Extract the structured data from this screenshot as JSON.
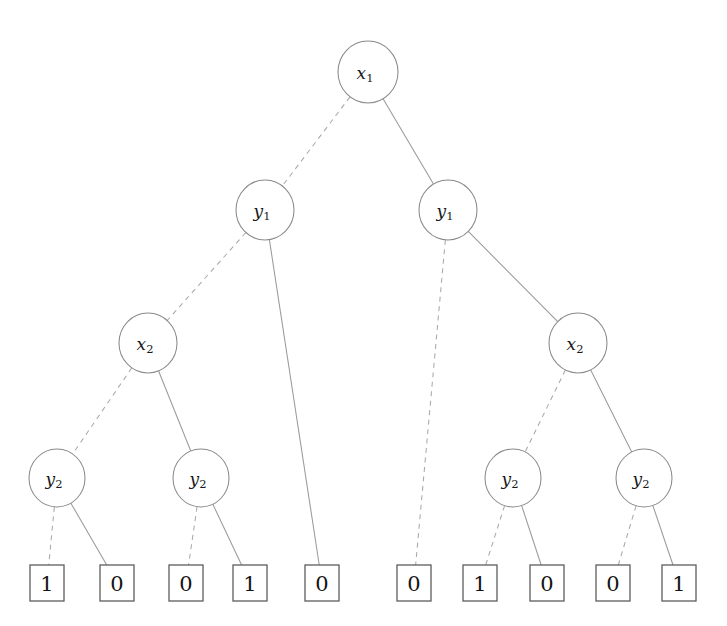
{
  "diagram": {
    "type": "binary-decision-diagram",
    "background_color": "#ffffff",
    "node_stroke_color": "#8a8a8a",
    "leaf_stroke_color": "#5d5d5d",
    "edge_solid_color": "#9a9a9a",
    "edge_dashed_color": "#a9a9a9",
    "text_color": "#18181a",
    "edge_legend": {
      "dashed": "0 / low branch (left)",
      "solid": "1 / high branch (right)"
    },
    "variables": [
      "x1",
      "y1",
      "x2",
      "y2"
    ],
    "levels": 4,
    "nodes": [
      {
        "id": "n0",
        "label_base": "x",
        "label_sub": "1",
        "level": 0,
        "cx": 368,
        "cy": 72,
        "rx": 30,
        "ry": 31
      },
      {
        "id": "n1",
        "label_base": "y",
        "label_sub": "1",
        "level": 1,
        "cx": 265,
        "cy": 210,
        "rx": 29,
        "ry": 30
      },
      {
        "id": "n2",
        "label_base": "y",
        "label_sub": "1",
        "level": 1,
        "cx": 448,
        "cy": 210,
        "rx": 29,
        "ry": 30
      },
      {
        "id": "n3",
        "label_base": "x",
        "label_sub": "2",
        "level": 2,
        "cx": 148,
        "cy": 343,
        "rx": 29,
        "ry": 30
      },
      {
        "id": "n4",
        "label_base": "x",
        "label_sub": "2",
        "level": 2,
        "cx": 578,
        "cy": 343,
        "rx": 29,
        "ry": 30
      },
      {
        "id": "n5",
        "label_base": "y",
        "label_sub": "2",
        "level": 3,
        "cx": 57,
        "cy": 478,
        "rx": 28,
        "ry": 29
      },
      {
        "id": "n6",
        "label_base": "y",
        "label_sub": "2",
        "level": 3,
        "cx": 201,
        "cy": 478,
        "rx": 28,
        "ry": 29
      },
      {
        "id": "n7",
        "label_base": "y",
        "label_sub": "2",
        "level": 3,
        "cx": 513,
        "cy": 478,
        "rx": 28,
        "ry": 29
      },
      {
        "id": "n8",
        "label_base": "y",
        "label_sub": "2",
        "level": 3,
        "cx": 644,
        "cy": 478,
        "rx": 28,
        "ry": 29
      }
    ],
    "leaves": [
      {
        "id": "l0",
        "value": "1",
        "cx": 47,
        "cy": 583,
        "w": 34,
        "h": 36
      },
      {
        "id": "l1",
        "value": "0",
        "cx": 117,
        "cy": 583,
        "w": 34,
        "h": 36
      },
      {
        "id": "l2",
        "value": "0",
        "cx": 186,
        "cy": 583,
        "w": 34,
        "h": 36
      },
      {
        "id": "l3",
        "value": "1",
        "cx": 250,
        "cy": 583,
        "w": 34,
        "h": 36
      },
      {
        "id": "l4",
        "value": "0",
        "cx": 322,
        "cy": 583,
        "w": 34,
        "h": 36
      },
      {
        "id": "l5",
        "value": "0",
        "cx": 414,
        "cy": 583,
        "w": 34,
        "h": 36
      },
      {
        "id": "l6",
        "value": "1",
        "cx": 480,
        "cy": 583,
        "w": 34,
        "h": 36
      },
      {
        "id": "l7",
        "value": "0",
        "cx": 547,
        "cy": 583,
        "w": 34,
        "h": 36
      },
      {
        "id": "l8",
        "value": "0",
        "cx": 613,
        "cy": 583,
        "w": 34,
        "h": 36
      },
      {
        "id": "l9",
        "value": "1",
        "cx": 679,
        "cy": 583,
        "w": 34,
        "h": 36
      }
    ],
    "edges": [
      {
        "from": "n0",
        "to": "n1",
        "style": "dashed",
        "branch": "0"
      },
      {
        "from": "n0",
        "to": "n2",
        "style": "solid",
        "branch": "1"
      },
      {
        "from": "n1",
        "to": "n3",
        "style": "dashed",
        "branch": "0"
      },
      {
        "from": "n1",
        "to": "l4",
        "style": "solid",
        "branch": "1"
      },
      {
        "from": "n2",
        "to": "l5",
        "style": "dashed",
        "branch": "0"
      },
      {
        "from": "n2",
        "to": "n4",
        "style": "solid",
        "branch": "1"
      },
      {
        "from": "n3",
        "to": "n5",
        "style": "dashed",
        "branch": "0"
      },
      {
        "from": "n3",
        "to": "n6",
        "style": "solid",
        "branch": "1"
      },
      {
        "from": "n4",
        "to": "n7",
        "style": "dashed",
        "branch": "0"
      },
      {
        "from": "n4",
        "to": "n8",
        "style": "solid",
        "branch": "1"
      },
      {
        "from": "n5",
        "to": "l0",
        "style": "dashed",
        "branch": "0"
      },
      {
        "from": "n5",
        "to": "l1",
        "style": "solid",
        "branch": "1"
      },
      {
        "from": "n6",
        "to": "l2",
        "style": "dashed",
        "branch": "0"
      },
      {
        "from": "n6",
        "to": "l3",
        "style": "solid",
        "branch": "1"
      },
      {
        "from": "n7",
        "to": "l6",
        "style": "dashed",
        "branch": "0"
      },
      {
        "from": "n7",
        "to": "l7",
        "style": "solid",
        "branch": "1"
      },
      {
        "from": "n8",
        "to": "l8",
        "style": "dashed",
        "branch": "0"
      },
      {
        "from": "n8",
        "to": "l9",
        "style": "solid",
        "branch": "1"
      }
    ],
    "leaf_sequence": [
      "1",
      "0",
      "0",
      "1",
      "0",
      "0",
      "1",
      "0",
      "0",
      "1"
    ]
  }
}
